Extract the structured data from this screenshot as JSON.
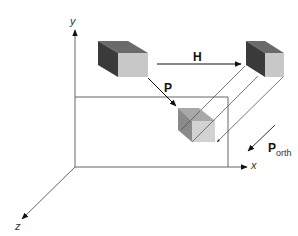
{
  "diagram": {
    "title": "",
    "axes": {
      "x_label": "x",
      "y_label": "y",
      "z_label": "z"
    },
    "labels": {
      "h_label": "H",
      "p_label": "P",
      "porth_main": "P",
      "porth_sub": "orth"
    },
    "colors": {
      "line": "#555555",
      "axis": "#666666",
      "cube_front": "#c8c8c8",
      "cube_side": "#3a3a3a",
      "cube_top": "#6a6a6a",
      "small_cube_front": "#d0d0d0",
      "small_cube_side": "#8a8a8a",
      "small_cube_top": "#a8a8a8"
    }
  }
}
